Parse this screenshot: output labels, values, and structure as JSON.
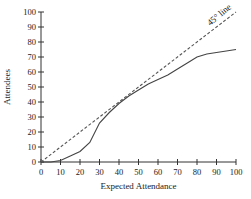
{
  "chart_data": {
    "type": "line",
    "title": "",
    "xlabel": "Expected Attendance",
    "ylabel": "Attendees",
    "xlim": [
      0,
      100
    ],
    "ylim": [
      0,
      100
    ],
    "grid": false,
    "x_ticks": [
      0,
      10,
      20,
      30,
      40,
      50,
      60,
      70,
      80,
      90,
      100
    ],
    "y_ticks": [
      0,
      10,
      20,
      30,
      40,
      50,
      60,
      70,
      80,
      90,
      100
    ],
    "annotations": [
      "45° line"
    ],
    "series": [
      {
        "name": "Attendees",
        "style": "solid",
        "x": [
          0,
          5,
          10,
          15,
          20,
          25,
          30,
          35,
          40,
          45,
          50,
          55,
          60,
          65,
          70,
          75,
          80,
          85,
          90,
          95,
          100
        ],
        "y": [
          0,
          0,
          1,
          4,
          7,
          13,
          26,
          33,
          39,
          44,
          48,
          52,
          55,
          58,
          62,
          66,
          70,
          72,
          73,
          74,
          75
        ]
      },
      {
        "name": "45° line",
        "style": "dashed",
        "x": [
          0,
          100
        ],
        "y": [
          0,
          100
        ]
      }
    ]
  }
}
